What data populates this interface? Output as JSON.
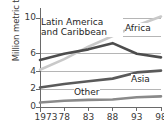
{
  "chart_data": {
    "type": "line",
    "title": "",
    "xlabel": "",
    "ylabel": "Million metric tons",
    "x": [
      1973,
      1978,
      1983,
      1988,
      1993,
      1998
    ],
    "xtick_labels": [
      "1973",
      "78",
      "83",
      "88",
      "93",
      "98"
    ],
    "ytick_labels": [
      "0",
      "2",
      "4",
      "6",
      "10"
    ],
    "ytick_values": [
      0,
      2,
      4,
      6,
      10
    ],
    "hidden_ytick_label": "8",
    "ylim": [
      0,
      10.6
    ],
    "xlim": [
      1973,
      1998
    ],
    "grid": true,
    "grid_axis": "y",
    "legend_position": "inline-annotations",
    "series": [
      {
        "name": "Africa",
        "color": "#c9c9c9",
        "values": [
          4.2,
          5.4,
          6.8,
          8.0,
          9.2,
          10.2
        ]
      },
      {
        "name": "Latin America and Caribbean",
        "color": "#4d4d4d",
        "values": [
          5.3,
          6.0,
          6.5,
          7.2,
          6.0,
          5.6
        ]
      },
      {
        "name": "Asia",
        "color": "#5a5a5a",
        "values": [
          2.2,
          2.6,
          2.9,
          3.2,
          3.9,
          4.1
        ]
      },
      {
        "name": "Other",
        "color": "#8a8a8a",
        "values": [
          0.5,
          0.7,
          0.8,
          0.85,
          1.1,
          1.2
        ]
      }
    ]
  },
  "annotations": {
    "africa": "Africa",
    "latin_america": "Latin America and Caribbean",
    "asia": "Asia",
    "other": "Other"
  },
  "axis": {
    "y_title": "Million metric tons"
  }
}
